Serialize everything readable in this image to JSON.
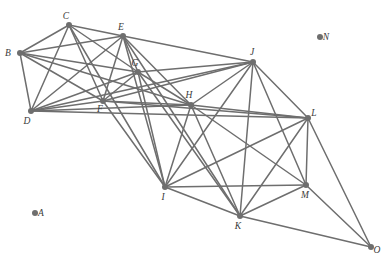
{
  "figure": {
    "type": "node-link-graph",
    "width": 391,
    "height": 263,
    "background_color": "#ffffff",
    "node_color": "#6e6e6e",
    "edge_color": "#6e6e6e",
    "label_color": "#3a3a3a",
    "node_radius": 3,
    "edge_width": 1.5,
    "node_count": 15,
    "edge_count": 55,
    "isolated_nodes": [
      "A",
      "N"
    ]
  },
  "chart_data": {
    "type": "scatter",
    "title": "",
    "xlabel": "",
    "ylabel": "",
    "nodes": [
      {
        "id": "A",
        "label": "A",
        "x": 35,
        "y": 213,
        "label_dx": 6,
        "label_dy": 3
      },
      {
        "id": "B",
        "label": "B",
        "x": 20,
        "y": 53,
        "label_dx": -12,
        "label_dy": 3
      },
      {
        "id": "C",
        "label": "C",
        "x": 69,
        "y": 25,
        "label_dx": -3,
        "label_dy": -6
      },
      {
        "id": "D",
        "label": "D",
        "x": 31,
        "y": 111,
        "label_dx": -4,
        "label_dy": 13
      },
      {
        "id": "E",
        "label": "E",
        "x": 123,
        "y": 36,
        "label_dx": -2,
        "label_dy": -6
      },
      {
        "id": "F",
        "label": "F",
        "x": 103,
        "y": 101,
        "label_dx": -3,
        "label_dy": 11
      },
      {
        "id": "G",
        "label": "G",
        "x": 138,
        "y": 72,
        "label_dx": -3,
        "label_dy": -6
      },
      {
        "id": "H",
        "label": "H",
        "x": 191,
        "y": 105,
        "label_dx": -2,
        "label_dy": -7
      },
      {
        "id": "I",
        "label": "I",
        "x": 165,
        "y": 187,
        "label_dx": -2,
        "label_dy": 13
      },
      {
        "id": "J",
        "label": "J",
        "x": 253,
        "y": 62,
        "label_dx": -1,
        "label_dy": -7
      },
      {
        "id": "K",
        "label": "K",
        "x": 240,
        "y": 216,
        "label_dx": -2,
        "label_dy": 13
      },
      {
        "id": "L",
        "label": "L",
        "x": 308,
        "y": 118,
        "label_dx": 6,
        "label_dy": -2
      },
      {
        "id": "M",
        "label": "M",
        "x": 306,
        "y": 185,
        "label_dx": -1,
        "label_dy": 13
      },
      {
        "id": "N",
        "label": "N",
        "x": 320,
        "y": 37,
        "label_dx": 6,
        "label_dy": 3
      },
      {
        "id": "O",
        "label": "O",
        "x": 371,
        "y": 247,
        "label_dx": 6,
        "label_dy": 6
      }
    ],
    "edges": [
      [
        "B",
        "C"
      ],
      [
        "B",
        "D"
      ],
      [
        "B",
        "E"
      ],
      [
        "B",
        "F"
      ],
      [
        "B",
        "G"
      ],
      [
        "B",
        "H"
      ],
      [
        "C",
        "D"
      ],
      [
        "C",
        "E"
      ],
      [
        "C",
        "F"
      ],
      [
        "C",
        "G"
      ],
      [
        "C",
        "I"
      ],
      [
        "D",
        "E"
      ],
      [
        "D",
        "F"
      ],
      [
        "D",
        "G"
      ],
      [
        "D",
        "H"
      ],
      [
        "D",
        "J"
      ],
      [
        "D",
        "L"
      ],
      [
        "E",
        "F"
      ],
      [
        "E",
        "G"
      ],
      [
        "E",
        "H"
      ],
      [
        "E",
        "I"
      ],
      [
        "E",
        "J"
      ],
      [
        "E",
        "K"
      ],
      [
        "F",
        "G"
      ],
      [
        "F",
        "H"
      ],
      [
        "F",
        "I"
      ],
      [
        "F",
        "J"
      ],
      [
        "F",
        "L"
      ],
      [
        "G",
        "H"
      ],
      [
        "G",
        "I"
      ],
      [
        "G",
        "J"
      ],
      [
        "G",
        "K"
      ],
      [
        "H",
        "I"
      ],
      [
        "H",
        "J"
      ],
      [
        "H",
        "K"
      ],
      [
        "H",
        "L"
      ],
      [
        "H",
        "M"
      ],
      [
        "I",
        "J"
      ],
      [
        "I",
        "K"
      ],
      [
        "I",
        "L"
      ],
      [
        "I",
        "M"
      ],
      [
        "I",
        "H"
      ],
      [
        "J",
        "K"
      ],
      [
        "J",
        "L"
      ],
      [
        "J",
        "M"
      ],
      [
        "J",
        "I"
      ],
      [
        "K",
        "L"
      ],
      [
        "K",
        "M"
      ],
      [
        "K",
        "O"
      ],
      [
        "L",
        "M"
      ],
      [
        "L",
        "O"
      ],
      [
        "L",
        "I"
      ],
      [
        "M",
        "O"
      ],
      [
        "M",
        "K"
      ],
      [
        "G",
        "E"
      ]
    ]
  }
}
